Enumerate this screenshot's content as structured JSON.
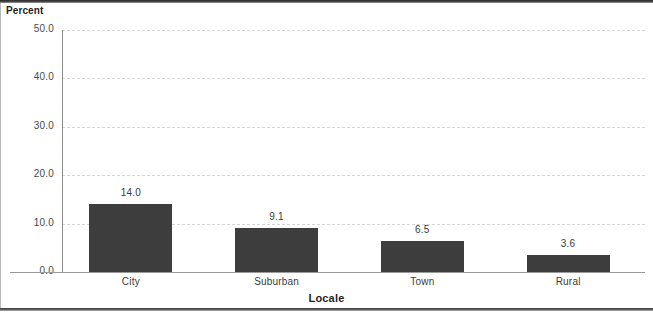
{
  "chart_data": {
    "type": "bar",
    "title": "",
    "xlabel": "Locale",
    "ylabel": "Percent",
    "categories": [
      "City",
      "Suburban",
      "Town",
      "Rural"
    ],
    "values": [
      14.0,
      9.1,
      6.5,
      3.6
    ],
    "value_labels": [
      "14.0",
      "9.1",
      "6.5",
      "3.6"
    ],
    "ylim": [
      0.0,
      50.0
    ],
    "ytick_values": [
      0.0,
      10.0,
      20.0,
      30.0,
      40.0,
      50.0
    ],
    "ytick_labels": [
      "0.0",
      "10.0",
      "20.0",
      "30.0",
      "40.0",
      "50.0"
    ],
    "grid": "horizontal-dashed",
    "legend": "none",
    "bar_color": "#3d3d3d",
    "gridline_color": "#d6d6d6",
    "axis_color": "#8d8d8d"
  }
}
